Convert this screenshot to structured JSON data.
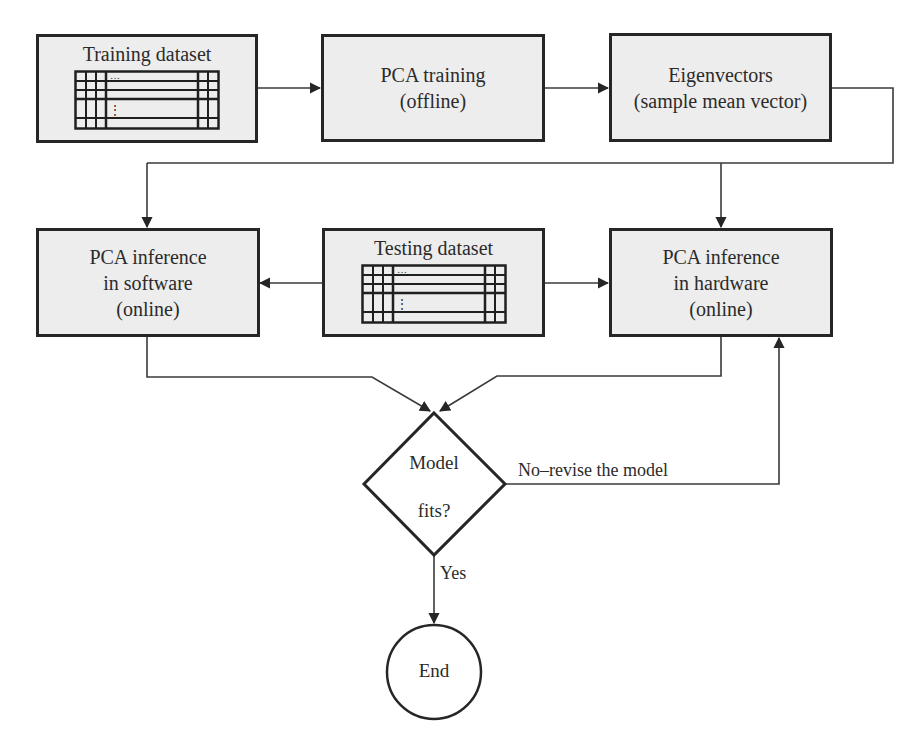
{
  "nodes": {
    "training_dataset": {
      "title": "Training dataset"
    },
    "pca_training": {
      "line1": "PCA training",
      "line2": "(offline)"
    },
    "eigenvectors": {
      "line1": "Eigenvectors",
      "line2": "(sample mean vector)"
    },
    "inference_software": {
      "line1": "PCA inference",
      "line2": "in software",
      "line3": "(online)"
    },
    "testing_dataset": {
      "title": "Testing dataset"
    },
    "inference_hardware": {
      "line1": "PCA inference",
      "line2": "in hardware",
      "line3": "(online)"
    },
    "decision": {
      "line1": "Model",
      "line2": "fits?"
    },
    "end": {
      "label": "End"
    }
  },
  "edges": {
    "no_label": "No–revise the model",
    "yes_label": "Yes"
  },
  "table_glyphs": {
    "ellipsis_h": "…",
    "ellipsis_v": "⋮"
  },
  "colors": {
    "box_fill": "#ededed",
    "stroke": "#262626",
    "line": "#3a3a3a",
    "background": "#ffffff"
  }
}
